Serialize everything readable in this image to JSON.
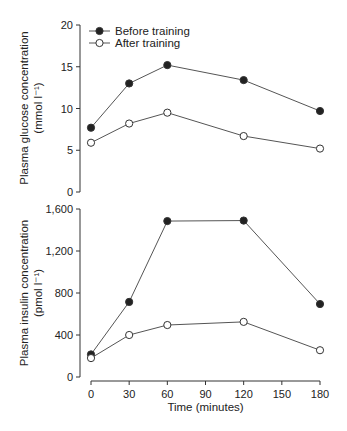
{
  "chart_data": [
    {
      "type": "line",
      "title": "",
      "xlabel": "",
      "ylabel": "Plasma glucose concentration",
      "ylabel_units": "(mmol l⁻¹)",
      "ylim": [
        0,
        20
      ],
      "yticks": [
        0,
        5,
        10,
        15,
        20
      ],
      "x": [
        0,
        30,
        60,
        120,
        180
      ],
      "legend_position": "upper left",
      "grid": false,
      "series": [
        {
          "name": "Before training",
          "marker": "filled-circle",
          "values": [
            7.7,
            13.0,
            15.2,
            13.4,
            9.7
          ]
        },
        {
          "name": "After training",
          "marker": "open-circle",
          "values": [
            5.9,
            8.2,
            9.5,
            6.7,
            5.2
          ]
        }
      ]
    },
    {
      "type": "line",
      "title": "",
      "xlabel": "Time (minutes)",
      "ylabel": "Plasma insulin concentration",
      "ylabel_units": "(pmol l⁻¹)",
      "ylim": [
        0,
        1600
      ],
      "yticks": [
        0,
        400,
        800,
        1200,
        1600
      ],
      "ytick_labels": [
        "0",
        "400",
        "800",
        "1,200",
        "1,600"
      ],
      "xticks": [
        0,
        30,
        60,
        90,
        120,
        150,
        180
      ],
      "x": [
        0,
        30,
        60,
        120,
        180
      ],
      "grid": false,
      "series": [
        {
          "name": "Before training",
          "marker": "filled-circle",
          "values": [
            215,
            715,
            1485,
            1490,
            695
          ]
        },
        {
          "name": "After training",
          "marker": "open-circle",
          "values": [
            180,
            400,
            495,
            525,
            255
          ]
        }
      ]
    }
  ]
}
